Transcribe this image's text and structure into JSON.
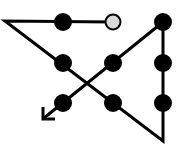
{
  "diagram": {
    "colors": {
      "line": "#000000",
      "dot": "#000000",
      "start_dot": "#d9d9d9",
      "background": "#ffffff"
    },
    "dots": [
      {
        "id": "r1c1",
        "x": 63,
        "y": 22,
        "type": "filled"
      },
      {
        "id": "r1c2",
        "x": 113,
        "y": 22,
        "type": "start"
      },
      {
        "id": "r1c3",
        "x": 163,
        "y": 22,
        "type": "filled"
      },
      {
        "id": "r2c1",
        "x": 63,
        "y": 63,
        "type": "filled"
      },
      {
        "id": "r2c2",
        "x": 113,
        "y": 63,
        "type": "filled"
      },
      {
        "id": "r2c3",
        "x": 163,
        "y": 63,
        "type": "filled"
      },
      {
        "id": "r3c1",
        "x": 63,
        "y": 103,
        "type": "filled"
      },
      {
        "id": "r3c2",
        "x": 113,
        "y": 103,
        "type": "filled"
      },
      {
        "id": "r3c3",
        "x": 163,
        "y": 103,
        "type": "filled"
      }
    ],
    "path": [
      [
        113,
        22
      ],
      [
        5,
        21
      ],
      [
        163,
        141
      ],
      [
        163,
        22
      ],
      [
        44,
        118
      ]
    ],
    "arrow_end": [
      44,
      118
    ]
  }
}
